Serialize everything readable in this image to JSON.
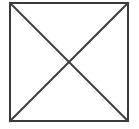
{
  "figure": {
    "name": "square-with-diagonals",
    "canvas": {
      "width": 139,
      "height": 129,
      "background_color": "#ffffff"
    },
    "shapes": {
      "square": {
        "label": "square-outline",
        "x": 10,
        "y": 3,
        "width": 118,
        "height": 118,
        "stroke_color": "#3a3a3c",
        "stroke_width": 2,
        "fill_color": "#ffffff",
        "corners": {
          "top_left": [
            10,
            3
          ],
          "top_right": [
            128,
            3
          ],
          "bottom_right": [
            128,
            121
          ],
          "bottom_left": [
            10,
            121
          ]
        }
      },
      "diagonal_tl_br": {
        "label": "diagonal-top-left-to-bottom-right",
        "x1": 10,
        "y1": 3,
        "x2": 128,
        "y2": 121,
        "stroke_color": "#3f3f41",
        "stroke_width": 2
      },
      "diagonal_tr_bl": {
        "label": "diagonal-top-right-to-bottom-left",
        "x1": 128,
        "y1": 3,
        "x2": 10,
        "y2": 121,
        "stroke_color": "#3f3f41",
        "stroke_width": 2
      },
      "intersection": {
        "label": "diagonal-intersection-center",
        "x": 69,
        "y": 62
      }
    }
  }
}
